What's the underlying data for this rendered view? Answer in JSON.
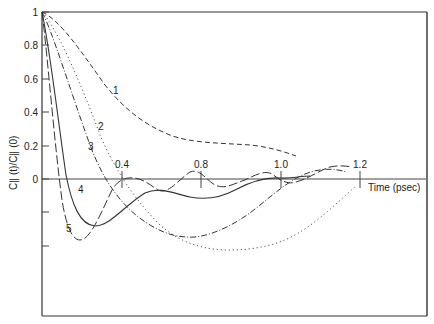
{
  "chart_data": {
    "type": "line",
    "title": "",
    "xlabel": "Time (psec)",
    "ylabel": "C∥ (t)/C∥ (0)",
    "x_ticks": [
      {
        "label": "0.4",
        "value": 0.4,
        "px": 122
      },
      {
        "label": "0.8",
        "value": 0.8,
        "px": 201
      },
      {
        "label": "1.0",
        "value": 1.0,
        "px": 281
      },
      {
        "label": "1.2",
        "value": 1.2,
        "px": 360
      }
    ],
    "y_ticks": [
      {
        "label": "1",
        "value": 1.0,
        "py": 12
      },
      {
        "label": "0.8",
        "value": 0.8,
        "py": 45
      },
      {
        "label": "0.6",
        "value": 0.6,
        "py": 79
      },
      {
        "label": "0.4",
        "value": 0.4,
        "py": 112
      },
      {
        "label": "0.2",
        "value": 0.2,
        "py": 146
      },
      {
        "label": "0",
        "value": 0.0,
        "py": 179
      },
      {
        "label": "",
        "value": -0.2,
        "py": 212
      },
      {
        "label": "",
        "value": -0.4,
        "py": 246
      }
    ],
    "xlim": [
      0,
      1.2
    ],
    "ylim": [
      -0.8,
      1.0
    ],
    "grid": false,
    "legend": "inline curve labels 1-5",
    "series": [
      {
        "name": "1",
        "style": "dashed",
        "label_pos": [
          113,
          94
        ],
        "points": [
          [
            0.0,
            1.0
          ],
          [
            0.05,
            0.97
          ],
          [
            0.1,
            0.88
          ],
          [
            0.15,
            0.76
          ],
          [
            0.2,
            0.62
          ],
          [
            0.25,
            0.5
          ],
          [
            0.3,
            0.4
          ],
          [
            0.35,
            0.32
          ],
          [
            0.4,
            0.26
          ],
          [
            0.5,
            0.2
          ],
          [
            0.6,
            0.16
          ],
          [
            0.7,
            0.15
          ],
          [
            0.8,
            0.14
          ],
          [
            0.9,
            0.13
          ],
          [
            0.98,
            0.11
          ],
          [
            1.0,
            0.1
          ]
        ],
        "path": "M42,12 C60,20 80,50 105,85 C125,110 145,125 170,135 C190,143 220,143 250,145 C270,147 285,152 296,156"
      },
      {
        "name": "2",
        "style": "dotted",
        "label_pos": [
          98,
          130
        ],
        "points": [
          [
            0.0,
            1.0
          ],
          [
            0.1,
            0.8
          ],
          [
            0.2,
            0.5
          ],
          [
            0.3,
            0.15
          ],
          [
            0.4,
            -0.05
          ],
          [
            0.5,
            -0.3
          ],
          [
            0.6,
            -0.4
          ],
          [
            0.7,
            -0.43
          ],
          [
            0.8,
            -0.42
          ],
          [
            0.9,
            -0.35
          ],
          [
            1.0,
            -0.22
          ],
          [
            1.1,
            -0.1
          ],
          [
            1.2,
            -0.04
          ]
        ],
        "path": "M42,12 C55,25 80,80 100,135 C115,170 135,200 160,225 C180,243 205,250 228,250 C255,250 280,245 300,232 C320,220 340,200 356,186"
      },
      {
        "name": "3",
        "style": "dash-dot",
        "label_pos": [
          88,
          150
        ],
        "points": [
          [
            0.0,
            1.0
          ],
          [
            0.1,
            0.72
          ],
          [
            0.2,
            0.35
          ],
          [
            0.3,
            0.02
          ],
          [
            0.4,
            -0.18
          ],
          [
            0.5,
            -0.3
          ],
          [
            0.6,
            -0.35
          ],
          [
            0.7,
            -0.33
          ],
          [
            0.8,
            -0.25
          ],
          [
            0.9,
            -0.12
          ],
          [
            1.0,
            0.0
          ],
          [
            1.1,
            0.05
          ],
          [
            1.2,
            0.05
          ]
        ],
        "path": "M42,12 C52,30 70,90 90,145 C105,185 125,210 150,225 C165,234 178,238 195,237 C215,235 240,222 260,205 C275,193 290,180 305,174 C320,168 335,168 346,172"
      },
      {
        "name": "4",
        "style": "solid",
        "label_pos": [
          78,
          193
        ],
        "points": [
          [
            0.0,
            1.0
          ],
          [
            0.05,
            0.75
          ],
          [
            0.1,
            0.3
          ],
          [
            0.15,
            -0.05
          ],
          [
            0.2,
            -0.25
          ],
          [
            0.25,
            -0.28
          ],
          [
            0.3,
            -0.22
          ],
          [
            0.4,
            -0.08
          ],
          [
            0.5,
            -0.08
          ],
          [
            0.6,
            -0.1
          ],
          [
            0.7,
            -0.06
          ],
          [
            0.8,
            0.0
          ],
          [
            0.9,
            0.02
          ],
          [
            1.0,
            0.0
          ],
          [
            1.1,
            0.01
          ]
        ],
        "path": "M42,12 C50,50 58,120 66,175 C72,205 80,225 95,226 C110,226 125,205 145,193 C160,186 175,194 190,197 C205,200 220,198 235,190 C248,183 265,177 280,178 C292,179 300,176 310,176"
      },
      {
        "name": "5",
        "style": "long-dashed",
        "label_pos": [
          66,
          232
        ],
        "points": [
          [
            0.0,
            1.0
          ],
          [
            0.05,
            0.55
          ],
          [
            0.1,
            0.0
          ],
          [
            0.15,
            -0.3
          ],
          [
            0.2,
            -0.36
          ],
          [
            0.25,
            -0.28
          ],
          [
            0.3,
            -0.12
          ],
          [
            0.4,
            0.0
          ],
          [
            0.5,
            -0.06
          ],
          [
            0.6,
            0.0
          ],
          [
            0.7,
            0.04
          ],
          [
            0.8,
            -0.01
          ],
          [
            0.9,
            0.03
          ],
          [
            1.0,
            -0.02
          ],
          [
            1.1,
            0.04
          ],
          [
            1.2,
            0.03
          ]
        ],
        "path": "M42,12 C48,60 54,140 62,200 C66,225 72,240 80,240 C90,240 100,215 112,190 C118,180 125,177 135,178 C145,180 150,185 158,190 C168,195 178,180 190,172 C200,168 206,180 215,185 C225,190 235,183 245,180 C255,175 265,170 272,174 C280,180 287,185 296,182 C310,178 320,170 330,167 C340,165 345,166 352,167"
      }
    ]
  },
  "axes": {
    "xlabel": "Time (psec)",
    "ylabel_main": "C",
    "ylabel_text": "C∥ (t)/C∥ (0)"
  }
}
